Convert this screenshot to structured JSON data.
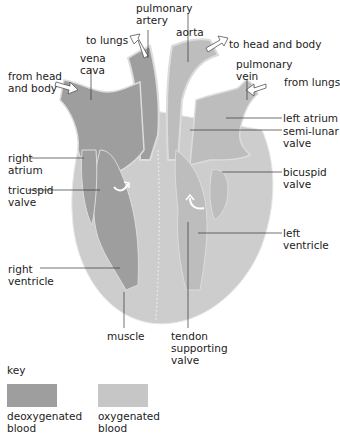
{
  "colors": {
    "deoxygenated": "#9e9e9e",
    "oxygenated": "#c6c6c6",
    "outline": "#e2e2e2",
    "label_line": "#333333"
  },
  "labels": {
    "pulmonary_artery": "pulmonary\nartery",
    "to_lungs": "to lungs",
    "aorta": "aorta",
    "to_head_and_body": "to head and body",
    "vena_cava": "vena\ncava",
    "from_head_and_body": "from head\nand body",
    "pulmonary_vein": "pulmonary\nvein",
    "from_lungs": "from lungs",
    "right_atrium": "right\natrium",
    "left_atrium": "left atrium",
    "semi_lunar_valve": "semi-lunar\nvalve",
    "tricuspid_valve": "tricuspid\nvalve",
    "bicuspid_valve": "bicuspid\nvalve",
    "left_ventricle": "left\nventricle",
    "right_ventricle": "right\nventricle",
    "muscle": "muscle",
    "tendon_supporting_valve": "tendon\nsupporting\nvalve"
  },
  "key": {
    "title": "key",
    "items": [
      {
        "label": "deoxygenated\nblood",
        "color": "#9e9e9e"
      },
      {
        "label": "oxygenated\nblood",
        "color": "#c6c6c6"
      }
    ]
  }
}
